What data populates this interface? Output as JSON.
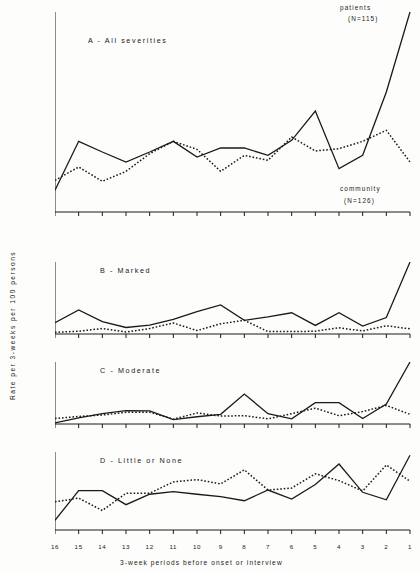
{
  "figure": {
    "ylabel": "Rate per 3-weeks per 100 persons",
    "xlabel": "3-week periods before onset or interview",
    "xticklabels": [
      "16",
      "15",
      "14",
      "13",
      "12",
      "11",
      "10",
      "9",
      "8",
      "7",
      "6",
      "5",
      "4",
      "3",
      "2",
      "1"
    ],
    "series_labels": {
      "patients": "patients",
      "patients_n": "(N=115)",
      "community": "community",
      "community_n": "(N=126)"
    },
    "colors": {
      "ink": "#1a1a1a",
      "background": "#fdfdfb"
    }
  },
  "chart_data": [
    {
      "type": "line",
      "title": "A - All severities",
      "panel": "A",
      "xlabel": "3-week periods before onset or interview",
      "ylabel": "Rate per 3-weeks per 100 persons",
      "x": [
        16,
        15,
        14,
        13,
        12,
        11,
        10,
        9,
        8,
        7,
        6,
        5,
        4,
        3,
        2,
        1
      ],
      "xticklabels": [
        "16",
        "15",
        "14",
        "13",
        "12",
        "11",
        "10",
        "9",
        "8",
        "7",
        "6",
        "5",
        "4",
        "3",
        "2",
        "1"
      ],
      "yticks": [
        0,
        3,
        6,
        9,
        12,
        15,
        18,
        21,
        24,
        27,
        30,
        33,
        36,
        39,
        42,
        45,
        48,
        51,
        54,
        57,
        60
      ],
      "ylim": [
        0,
        60
      ],
      "grid": false,
      "legend": "inline-annotations",
      "series": [
        {
          "name": "patients",
          "style": "solid",
          "values": [
            6.5,
            21.2,
            18.0,
            15.0,
            18.0,
            21.2,
            16.5,
            19.2,
            19.2,
            17.0,
            21.5,
            30.3,
            13.0,
            17.0,
            36.0,
            60.0
          ]
        },
        {
          "name": "community",
          "style": "dotted",
          "values": [
            9.5,
            13.5,
            9.2,
            12.2,
            17.5,
            21.2,
            18.8,
            12.2,
            17.0,
            15.5,
            22.5,
            18.3,
            19.0,
            21.2,
            24.5,
            15.0
          ]
        }
      ]
    },
    {
      "type": "line",
      "title": "B - Marked",
      "panel": "B",
      "x": [
        16,
        15,
        14,
        13,
        12,
        11,
        10,
        9,
        8,
        7,
        6,
        5,
        4,
        3,
        2,
        1
      ],
      "yticks": [
        0,
        3,
        6,
        9,
        12,
        15,
        18,
        21
      ],
      "ylim": [
        0,
        21
      ],
      "grid": false,
      "series": [
        {
          "name": "patients",
          "style": "solid",
          "values": [
            3.3,
            7.0,
            3.6,
            1.9,
            2.6,
            4.3,
            6.5,
            8.5,
            4.0,
            5.0,
            6.2,
            2.5,
            6.2,
            2.3,
            4.8,
            21.0
          ]
        },
        {
          "name": "community",
          "style": "dotted",
          "values": [
            0.5,
            0.8,
            1.6,
            0.6,
            1.6,
            3.2,
            1.0,
            3.0,
            4.0,
            0.7,
            0.7,
            0.8,
            1.8,
            0.9,
            2.4,
            1.5
          ]
        }
      ]
    },
    {
      "type": "line",
      "title": "C - Moderate",
      "panel": "C",
      "x": [
        16,
        15,
        14,
        13,
        12,
        11,
        10,
        9,
        8,
        7,
        6,
        5,
        4,
        3,
        2,
        1
      ],
      "yticks": [
        0,
        3,
        6,
        9,
        12,
        15,
        18
      ],
      "ylim": [
        0,
        18
      ],
      "grid": false,
      "series": [
        {
          "name": "patients",
          "style": "solid",
          "values": [
            0.3,
            1.8,
            3.0,
            3.9,
            3.8,
            1.3,
            2.1,
            2.8,
            8.7,
            3.0,
            1.5,
            6.2,
            6.2,
            1.6,
            5.8,
            18.0
          ]
        },
        {
          "name": "community",
          "style": "dotted",
          "values": [
            1.6,
            2.2,
            2.6,
            3.4,
            3.4,
            1.4,
            3.2,
            2.3,
            2.4,
            1.5,
            3.0,
            4.6,
            2.4,
            3.6,
            5.4,
            2.8
          ]
        }
      ]
    },
    {
      "type": "line",
      "title": "D - Little or None",
      "panel": "D",
      "x": [
        16,
        15,
        14,
        13,
        12,
        11,
        10,
        9,
        8,
        7,
        6,
        5,
        4,
        3,
        2,
        1
      ],
      "yticks": [
        0,
        3,
        6,
        9,
        12,
        15,
        18,
        21,
        24
      ],
      "ylim": [
        0,
        24
      ],
      "grid": false,
      "series": [
        {
          "name": "patients",
          "style": "solid",
          "values": [
            3.0,
            12.1,
            12.1,
            7.8,
            11.0,
            11.8,
            11.0,
            10.3,
            9.0,
            12.3,
            9.5,
            14.0,
            20.3,
            11.6,
            9.3,
            23.0
          ]
        },
        {
          "name": "community",
          "style": "dotted",
          "values": [
            8.7,
            9.8,
            6.0,
            11.3,
            11.3,
            14.8,
            15.5,
            14.2,
            18.5,
            12.3,
            12.9,
            17.3,
            15.2,
            12.0,
            20.0,
            15.0
          ]
        }
      ]
    }
  ]
}
